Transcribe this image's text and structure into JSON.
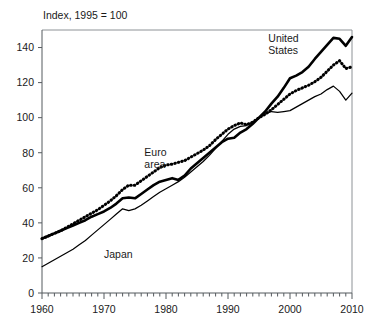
{
  "chart_data": {
    "type": "line",
    "title": "Index, 1995 = 100",
    "xlabel": "",
    "ylabel": "",
    "xlim": [
      1960,
      2010
    ],
    "ylim": [
      0,
      150
    ],
    "grid": false,
    "legend_position": "inline-annotations",
    "xticks": [
      1960,
      1970,
      1980,
      1990,
      2000,
      2010
    ],
    "xtick_labels": [
      "1960",
      "1970",
      "1980",
      "1990",
      "2000",
      "2010"
    ],
    "xminor_tick_step": 1,
    "yticks": [
      0,
      20,
      40,
      60,
      80,
      100,
      120,
      140
    ],
    "ytick_labels": [
      "0",
      "20",
      "40",
      "60",
      "80",
      "100",
      "120",
      "140"
    ],
    "x": [
      1960,
      1961,
      1962,
      1963,
      1964,
      1965,
      1966,
      1967,
      1968,
      1969,
      1970,
      1971,
      1972,
      1973,
      1974,
      1975,
      1976,
      1977,
      1978,
      1979,
      1980,
      1981,
      1982,
      1983,
      1984,
      1985,
      1986,
      1987,
      1988,
      1989,
      1990,
      1991,
      1992,
      1993,
      1994,
      1995,
      1996,
      1997,
      1998,
      1999,
      2000,
      2001,
      2002,
      2003,
      2004,
      2005,
      2006,
      2007,
      2008,
      2009,
      2010
    ],
    "series": [
      {
        "name": "United States",
        "style": "thick-solid",
        "color": "#000000",
        "label_text": "United States",
        "values": [
          31,
          32.5,
          34,
          35.5,
          37,
          38.5,
          40,
          41.5,
          43.5,
          45,
          46.5,
          48.5,
          51,
          54,
          54.5,
          54,
          56.5,
          59,
          61.5,
          63.5,
          64.5,
          65.5,
          64.5,
          67,
          71,
          74,
          77,
          80,
          83,
          86,
          88,
          88.5,
          91.5,
          93.5,
          96.5,
          100,
          103.5,
          108,
          112,
          117,
          122.5,
          124,
          126,
          129,
          133.5,
          137.5,
          141.5,
          145.5,
          145,
          141,
          146
        ]
      },
      {
        "name": "Euro area",
        "style": "thick-dotted",
        "color": "#000000",
        "label_text": "Euro area",
        "values": [
          31,
          32.5,
          34,
          35.5,
          37.5,
          39.5,
          41.5,
          43.5,
          45.5,
          47.5,
          50,
          52.5,
          55.5,
          59,
          61.5,
          61.5,
          64,
          66.5,
          69,
          71.5,
          73,
          73.5,
          74.5,
          75.5,
          77.5,
          79.5,
          81.5,
          84,
          87.5,
          90.5,
          93.5,
          95.5,
          97,
          96,
          97.5,
          100,
          102,
          104.5,
          107.5,
          110.5,
          113.5,
          115.5,
          117,
          118.5,
          120.5,
          123,
          126.5,
          130,
          132.5,
          128,
          129
        ]
      },
      {
        "name": "Japan",
        "style": "thin-solid",
        "color": "#000000",
        "label_text": "Japan",
        "values": [
          15,
          17,
          19,
          21,
          23,
          25,
          27.5,
          30,
          33,
          36,
          39,
          42,
          45,
          48,
          47,
          48,
          50,
          52.5,
          55,
          57.5,
          59.5,
          61.5,
          63.5,
          66,
          69,
          72,
          75,
          78.5,
          82.5,
          86.5,
          90.5,
          93.5,
          95,
          95.5,
          97.5,
          100,
          102,
          103.5,
          103,
          103.5,
          104,
          106,
          108,
          110,
          112,
          113.5,
          116,
          118,
          115,
          110,
          114
        ]
      }
    ],
    "annotations": [
      {
        "text": "United States",
        "lines": [
          "United",
          "States"
        ],
        "x": 1996.5,
        "y": 143
      },
      {
        "text": "Euro area",
        "lines": [
          "Euro",
          "area"
        ],
        "x": 1976.5,
        "y": 78
      },
      {
        "text": "Japan",
        "lines": [
          "Japan"
        ],
        "x": 1970.0,
        "y": 20
      }
    ]
  }
}
